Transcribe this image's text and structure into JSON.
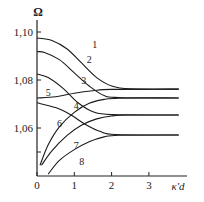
{
  "chart_data": {
    "type": "line",
    "title": "",
    "xlabel": "κd",
    "ylabel": "Ω",
    "xlim": [
      0,
      3.9
    ],
    "ylim": [
      1.04,
      1.11
    ],
    "x_ticks": [
      {
        "value": 0,
        "label": "0"
      },
      {
        "value": 1,
        "label": "1"
      },
      {
        "value": 2,
        "label": "2"
      },
      {
        "value": 3,
        "label": "3"
      }
    ],
    "y_ticks": [
      {
        "value": 1.1,
        "label": "1,10"
      },
      {
        "value": 1.08,
        "label": "1,08"
      },
      {
        "value": 1.06,
        "label": "1,06"
      },
      {
        "value": 1.05,
        "label": ""
      }
    ],
    "grid": false,
    "legend": "inline numeric labels 1-8",
    "series": [
      {
        "name": "1",
        "label_at": [
          1.55,
          1.0945
        ],
        "points": [
          [
            0,
            1.0975
          ],
          [
            0.4,
            1.0965
          ],
          [
            0.8,
            1.093
          ],
          [
            1.2,
            1.087
          ],
          [
            1.6,
            1.081
          ],
          [
            2.0,
            1.0775
          ],
          [
            2.5,
            1.0763
          ],
          [
            3.8,
            1.0762
          ]
        ]
      },
      {
        "name": "2",
        "label_at": [
          1.4,
          1.0885
        ],
        "points": [
          [
            0,
            1.0918
          ],
          [
            0.2,
            1.0915
          ],
          [
            0.6,
            1.0885
          ],
          [
            1.0,
            1.083
          ],
          [
            1.4,
            1.0775
          ],
          [
            1.8,
            1.0735
          ],
          [
            2.2,
            1.0727
          ],
          [
            3.8,
            1.0725
          ]
        ]
      },
      {
        "name": "3",
        "label_at": [
          1.25,
          1.0795
        ],
        "points": [
          [
            0,
            1.0825
          ],
          [
            0.3,
            1.081
          ],
          [
            0.7,
            1.0765
          ],
          [
            1.1,
            1.0705
          ],
          [
            1.5,
            1.0668
          ],
          [
            2.0,
            1.0656
          ],
          [
            3.8,
            1.0654
          ]
        ]
      },
      {
        "name": "5",
        "label_at": [
          0.3,
          1.0745
        ],
        "points": [
          [
            0,
            1.0725
          ],
          [
            0.5,
            1.073
          ],
          [
            1.0,
            1.0745
          ],
          [
            1.5,
            1.0755
          ],
          [
            2.0,
            1.0761
          ],
          [
            3.8,
            1.0762
          ]
        ]
      },
      {
        "name": "4",
        "label_at": [
          1.05,
          1.0692
        ],
        "points": [
          [
            0,
            1.0705
          ],
          [
            0.5,
            1.0685
          ],
          [
            0.9,
            1.0655
          ],
          [
            1.3,
            1.0615
          ],
          [
            1.7,
            1.0585
          ],
          [
            2.1,
            1.0573
          ],
          [
            3.8,
            1.0571
          ]
        ]
      },
      {
        "name": "6",
        "label_at": [
          0.6,
          1.0615
        ],
        "points": [
          [
            0.08,
            1.0445
          ],
          [
            0.3,
            1.053
          ],
          [
            0.6,
            1.0605
          ],
          [
            1.0,
            1.0665
          ],
          [
            1.4,
            1.0703
          ],
          [
            1.8,
            1.0719
          ],
          [
            2.2,
            1.0724
          ],
          [
            3.8,
            1.0725
          ]
        ]
      },
      {
        "name": "7",
        "label_at": [
          1.05,
          1.0525
        ],
        "points": [
          [
            0.12,
            1.0445
          ],
          [
            0.4,
            1.0505
          ],
          [
            0.8,
            1.0568
          ],
          [
            1.2,
            1.0612
          ],
          [
            1.6,
            1.0638
          ],
          [
            2.0,
            1.065
          ],
          [
            2.4,
            1.0654
          ],
          [
            3.8,
            1.0654
          ]
        ]
      },
      {
        "name": "8",
        "label_at": [
          1.2,
          1.046
        ],
        "points": [
          [
            0.3,
            1.0408
          ],
          [
            0.6,
            1.0465
          ],
          [
            1.0,
            1.051
          ],
          [
            1.4,
            1.0543
          ],
          [
            1.8,
            1.0563
          ],
          [
            2.2,
            1.057
          ],
          [
            3.8,
            1.0571
          ]
        ]
      }
    ]
  },
  "axes": {
    "y_title": "Ω",
    "x_title": "κ′d"
  }
}
